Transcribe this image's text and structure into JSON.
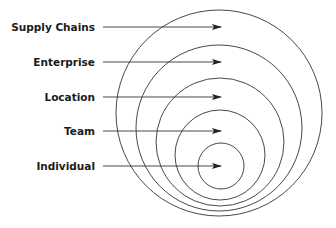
{
  "diagram": {
    "type": "nested-circles",
    "levels": [
      {
        "label": "Supply Chains",
        "y": 27,
        "cx": 219,
        "cy": 113,
        "r": 103
      },
      {
        "label": "Enterprise",
        "y": 62,
        "cx": 219,
        "cy": 128,
        "r": 83
      },
      {
        "label": "Location",
        "y": 97,
        "cx": 220,
        "cy": 142,
        "r": 64
      },
      {
        "label": "Team",
        "y": 131,
        "cx": 220,
        "cy": 155,
        "r": 45
      },
      {
        "label": "Individual",
        "y": 166,
        "cx": 221,
        "cy": 166,
        "r": 23
      }
    ],
    "line_color": "#333333",
    "text_color": "#1a1a1a"
  }
}
